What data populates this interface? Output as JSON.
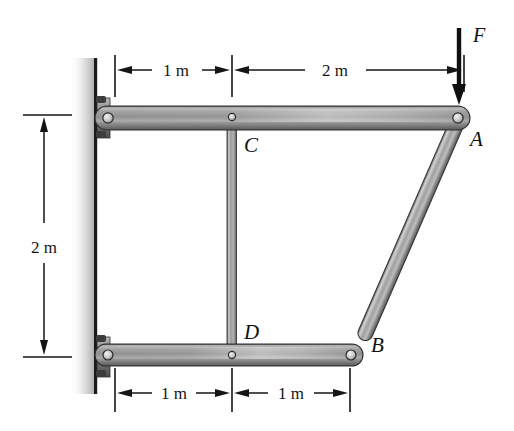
{
  "figure": {
    "background_color": "#ffffff",
    "width": 514,
    "height": 431
  },
  "dimensions": {
    "top_left": "1 m",
    "top_right": "2 m",
    "left_vertical": "2 m",
    "bottom_left": "1 m",
    "bottom_right": "1 m"
  },
  "labels": {
    "point_a": "A",
    "point_b": "B",
    "point_c": "C",
    "point_d": "D",
    "force": "F"
  },
  "colors": {
    "line": "#101010",
    "bar_light": "#e8e8e8",
    "bar_mid": "#9a9a9a",
    "bar_dark": "#4a4a4a",
    "wall": "#1a1a1a",
    "shadow": "#b9b9b9"
  },
  "members": {
    "top_bar": "top-horizontal-member-wall-to-A",
    "bottom_bar": "bottom-horizontal-member-wall-to-B",
    "vertical_bar": "vertical-member-C-to-D",
    "diagonal_bar": "diagonal-strut-A-to-B"
  }
}
